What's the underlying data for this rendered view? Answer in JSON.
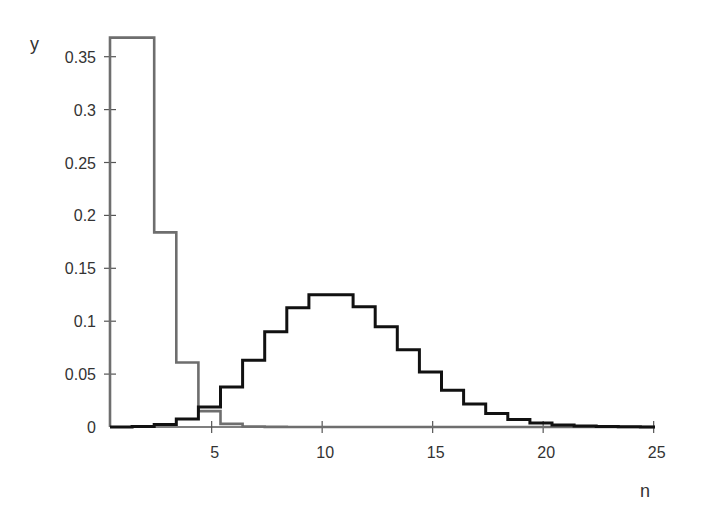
{
  "chart_data": {
    "type": "line",
    "style": "step",
    "title": "",
    "xlabel": "n",
    "ylabel": "y",
    "xlim": [
      0.4,
      25
    ],
    "ylim": [
      0,
      0.37
    ],
    "x_ticks": [
      5,
      10,
      15,
      20,
      25
    ],
    "y_ticks": [
      0,
      0.05,
      0.1,
      0.15,
      0.2,
      0.25,
      0.3,
      0.35
    ],
    "y_tick_labels": [
      "0",
      "0.05",
      "0.1",
      "0.15",
      "0.2",
      "0.25",
      "0.3",
      "0.35"
    ],
    "x_tick_labels": [
      "5",
      "10",
      "15",
      "20",
      "25"
    ],
    "grid": false,
    "legend": null,
    "x": [
      0,
      1,
      2,
      3,
      4,
      5,
      6,
      7,
      8,
      9,
      10,
      11,
      12,
      13,
      14,
      15,
      16,
      17,
      18,
      19,
      20,
      21,
      22,
      23,
      24
    ],
    "series": [
      {
        "name": "gray (Poisson mean 1)",
        "color": "#6e6e6e",
        "values": [
          0.368,
          0.368,
          0.184,
          0.061,
          0.015,
          0.003,
          0.0005,
          0.0001,
          0,
          0,
          0,
          0,
          0,
          0,
          0,
          0,
          0,
          0,
          0,
          0,
          0,
          0,
          0,
          0,
          0
        ]
      },
      {
        "name": "black (Poisson mean 10)",
        "color": "#111111",
        "values": [
          5e-05,
          0.0005,
          0.0023,
          0.0076,
          0.0189,
          0.0378,
          0.0631,
          0.0901,
          0.1126,
          0.1251,
          0.1251,
          0.1137,
          0.0948,
          0.0729,
          0.0521,
          0.0347,
          0.0217,
          0.0128,
          0.0071,
          0.0037,
          0.0019,
          0.0009,
          0.0004,
          0.0002,
          0.0001
        ]
      }
    ]
  }
}
